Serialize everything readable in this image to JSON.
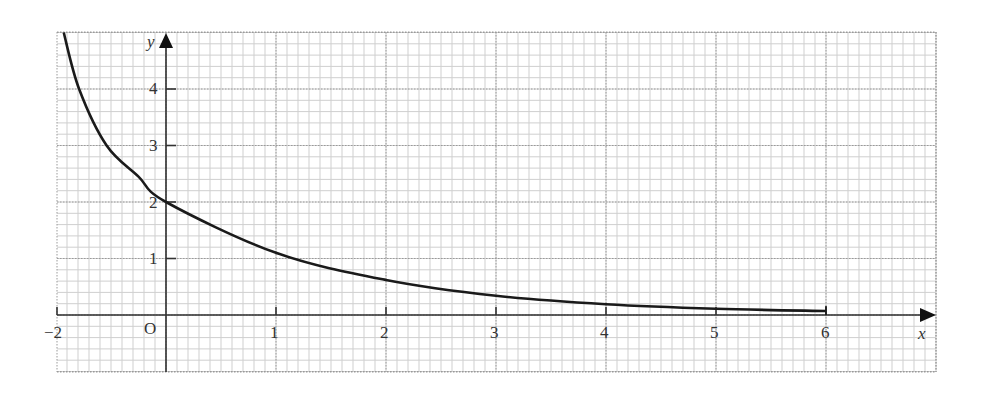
{
  "chart_data": {
    "type": "line",
    "title": "",
    "xlabel": "x",
    "ylabel": "y",
    "origin_label": "O",
    "x_ticks": [
      "−2",
      "1",
      "2",
      "3",
      "4",
      "5",
      "6"
    ],
    "y_ticks": [
      "1",
      "2",
      "3",
      "4"
    ],
    "xlim": [
      -2,
      7
    ],
    "ylim": [
      -1,
      5
    ],
    "grid": true,
    "legend": null,
    "series": [
      {
        "name": "curve",
        "x": [
          -0.93,
          -0.79,
          -0.54,
          -0.25,
          0,
          1,
          2,
          3,
          4,
          5,
          6
        ],
        "y": [
          5.0,
          4.0,
          3.0,
          2.45,
          2.0,
          1.1,
          0.62,
          0.34,
          0.19,
          0.11,
          0.07
        ]
      }
    ],
    "colors": {
      "curve": "#1a1a1a",
      "axis": "#333333",
      "grid_minor": "#cfcfcf",
      "grid_major": "#9a9a9a"
    }
  }
}
